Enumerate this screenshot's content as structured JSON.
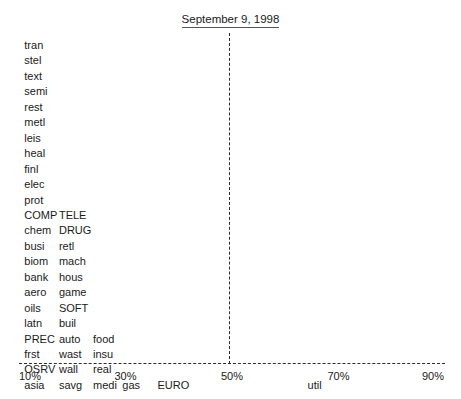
{
  "title": "September 9, 1998",
  "chart_data": {
    "type": "scatter",
    "title": "September 9, 1998",
    "xlabel": "",
    "ylabel": "",
    "xlim": [
      10,
      90
    ],
    "x_unit": "%",
    "grid": false,
    "legend": null,
    "xticks": [
      {
        "label": "10%",
        "value": 10
      },
      {
        "label": "30%",
        "value": 30
      },
      {
        "label": "50%",
        "value": 50
      },
      {
        "label": "70%",
        "value": 70
      },
      {
        "label": "90%",
        "value": 90
      }
    ],
    "annotations": [
      {
        "name": "reference-line",
        "type": "vline",
        "value": 50,
        "style": "dashed"
      },
      {
        "name": "axis-line",
        "type": "hline",
        "style": "dashed"
      }
    ],
    "note": "Each text label is a data point positioned at its x value (percent); rows stack vertically where points share the same x bucket.",
    "rows": [
      {
        "row": 1,
        "points": [
          {
            "label": "tran",
            "x": 11
          }
        ]
      },
      {
        "row": 2,
        "points": [
          {
            "label": "stel",
            "x": 11
          }
        ]
      },
      {
        "row": 3,
        "points": [
          {
            "label": "text",
            "x": 11
          }
        ]
      },
      {
        "row": 4,
        "points": [
          {
            "label": "semi",
            "x": 11
          }
        ]
      },
      {
        "row": 5,
        "points": [
          {
            "label": "rest",
            "x": 11
          }
        ]
      },
      {
        "row": 6,
        "points": [
          {
            "label": "metl",
            "x": 11
          }
        ]
      },
      {
        "row": 7,
        "points": [
          {
            "label": "leis",
            "x": 11
          }
        ]
      },
      {
        "row": 8,
        "points": [
          {
            "label": "heal",
            "x": 11
          }
        ]
      },
      {
        "row": 9,
        "points": [
          {
            "label": "finl",
            "x": 11
          }
        ]
      },
      {
        "row": 10,
        "points": [
          {
            "label": "elec",
            "x": 11
          }
        ]
      },
      {
        "row": 11,
        "points": [
          {
            "label": "prot",
            "x": 11
          }
        ]
      },
      {
        "row": 12,
        "points": [
          {
            "label": "COMP",
            "x": 11
          },
          {
            "label": "TELE",
            "x": 17.5
          }
        ]
      },
      {
        "row": 13,
        "points": [
          {
            "label": "chem",
            "x": 11
          },
          {
            "label": "DRUG",
            "x": 17.5
          }
        ]
      },
      {
        "row": 14,
        "points": [
          {
            "label": "busi",
            "x": 11
          },
          {
            "label": "retl",
            "x": 17.5
          }
        ]
      },
      {
        "row": 15,
        "points": [
          {
            "label": "biom",
            "x": 11
          },
          {
            "label": "mach",
            "x": 17.5
          }
        ]
      },
      {
        "row": 16,
        "points": [
          {
            "label": "bank",
            "x": 11
          },
          {
            "label": "hous",
            "x": 17.5
          }
        ]
      },
      {
        "row": 17,
        "points": [
          {
            "label": "aero",
            "x": 11
          },
          {
            "label": "game",
            "x": 17.5
          }
        ]
      },
      {
        "row": 18,
        "points": [
          {
            "label": "oils",
            "x": 11
          },
          {
            "label": "SOFT",
            "x": 17.5
          }
        ]
      },
      {
        "row": 19,
        "points": [
          {
            "label": "latn",
            "x": 11
          },
          {
            "label": "buil",
            "x": 17.5
          }
        ]
      },
      {
        "row": 20,
        "points": [
          {
            "label": "PREC",
            "x": 11
          },
          {
            "label": "auto",
            "x": 17.5
          },
          {
            "label": "food",
            "x": 23.9
          }
        ]
      },
      {
        "row": 21,
        "points": [
          {
            "label": "frst",
            "x": 11
          },
          {
            "label": "wast",
            "x": 17.5
          },
          {
            "label": "insu",
            "x": 23.9
          }
        ]
      },
      {
        "row": 22,
        "points": [
          {
            "label": "OSRV",
            "x": 11
          },
          {
            "label": "wall",
            "x": 17.5
          },
          {
            "label": "real",
            "x": 23.9
          }
        ]
      },
      {
        "row": 23,
        "points": [
          {
            "label": "asia",
            "x": 11
          },
          {
            "label": "savg",
            "x": 17.5
          },
          {
            "label": "medi",
            "x": 23.9
          },
          {
            "label": "gas",
            "x": 29.4
          },
          {
            "label": "EURO",
            "x": 36.0
          },
          {
            "label": "util",
            "x": 64.2
          }
        ]
      }
    ]
  },
  "geometry": {
    "plot_left_px": 19,
    "plot_right_px": 445,
    "x_min": 10,
    "x_max": 90,
    "first_row_top_px": 39,
    "row_step_px": 15.45,
    "axis_y_px": 363,
    "reference_x_px": 228.5
  }
}
